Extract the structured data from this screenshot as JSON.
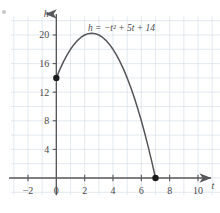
{
  "figure": {
    "corner_mark": "bullet-mark"
  },
  "chart_data": {
    "type": "line",
    "title": "",
    "subtitle": "",
    "xlabel": "t",
    "ylabel": "h",
    "equation": "h = −t² + 5t + 14",
    "equation_label_position": {
      "t": 4.6,
      "h": 20.6
    },
    "function": "h = -t^2 + 5t + 14",
    "xlim": [
      -3.2,
      11.6
    ],
    "ylim": [
      -2.4,
      22.6
    ],
    "grid": true,
    "grid_spacing": {
      "x": 1,
      "y": 2
    },
    "grid_color": "#d8dfe8",
    "axis_color": "#58585a",
    "curve_color": "#56565a",
    "point_color": "#1c1c1c",
    "legend": "none",
    "xticks": [
      -2,
      0,
      2,
      4,
      6,
      8,
      10
    ],
    "xtick_labels": [
      "−2",
      "0",
      "2",
      "4",
      "6",
      "8",
      "10"
    ],
    "yticks": [
      4,
      8,
      12,
      16,
      20
    ],
    "ytick_labels": [
      "4",
      "8",
      "12",
      "16",
      "20"
    ],
    "domain": [
      0,
      7
    ],
    "vertex": {
      "t": 2.5,
      "h": 20.25
    },
    "marked_points": [
      {
        "t": 0,
        "h": 14,
        "name": "y-intercept"
      },
      {
        "t": 7,
        "h": 0,
        "name": "positive-root"
      }
    ],
    "x": [
      0,
      0.25,
      0.5,
      0.75,
      1,
      1.25,
      1.5,
      1.75,
      2,
      2.25,
      2.5,
      2.75,
      3,
      3.25,
      3.5,
      3.75,
      4,
      4.25,
      4.5,
      4.75,
      5,
      5.25,
      5.5,
      5.75,
      6,
      6.25,
      6.5,
      6.75,
      7
    ],
    "values": [
      14,
      15.1875,
      16.25,
      17.1875,
      18,
      18.6875,
      19.25,
      19.6875,
      20,
      20.1875,
      20.25,
      20.1875,
      20,
      19.6875,
      19.25,
      18.6875,
      18,
      17.1875,
      16.25,
      15.1875,
      14,
      12.6875,
      11.25,
      9.6875,
      8,
      6.1875,
      4.25,
      2.1875,
      0
    ]
  }
}
